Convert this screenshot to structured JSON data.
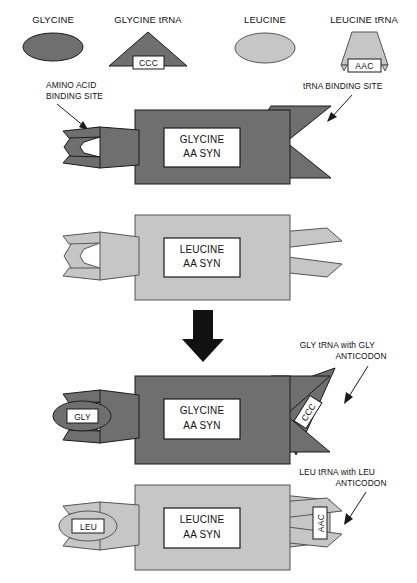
{
  "figure": {
    "background_color": "#ffffff",
    "palette": {
      "dark_gray": "#6f6f6f",
      "light_gray": "#c6c6c6",
      "outline": "#1a1a1a",
      "white": "#ffffff",
      "black": "#111111"
    }
  },
  "legend": {
    "items": [
      {
        "key": "glycine",
        "label": "GLYCINE",
        "shape": "ellipse",
        "fill": "#6f6f6f",
        "codon": null
      },
      {
        "key": "glycine_trna",
        "label": "GLYCINE tRNA",
        "shape": "triangle",
        "fill": "#6f6f6f",
        "codon": "CCC"
      },
      {
        "key": "leucine",
        "label": "LEUCINE",
        "shape": "ellipse",
        "fill": "#c6c6c6",
        "codon": null
      },
      {
        "key": "leucine_trna",
        "label": "LEUCINE tRNA",
        "shape": "trapezoid",
        "fill": "#c6c6c6",
        "codon": "AAC"
      }
    ]
  },
  "annotations": {
    "amino_acid_binding_site": {
      "line1": "AMINO ACID",
      "line2": "BINDING SITE"
    },
    "trna_binding_site": {
      "line1": "tRNA BINDING SITE",
      "line2": ""
    },
    "gly_trna_anticodon": {
      "line1": "GLY tRNA with GLY",
      "line2": "ANTICODON"
    },
    "leu_trna_anticodon": {
      "line1": "LEU tRNA with LEU",
      "line2": "ANTICODON"
    }
  },
  "panels": [
    {
      "key": "glycine_synthetase_empty",
      "enzyme_line1": "GLYCINE",
      "enzyme_line2": "AA SYN",
      "fill": "#6f6f6f",
      "bound_amino_acid": null,
      "bound_trna_codon": null
    },
    {
      "key": "leucine_synthetase_empty",
      "enzyme_line1": "LEUCINE",
      "enzyme_line2": "AA SYN",
      "fill": "#c6c6c6",
      "bound_amino_acid": null,
      "bound_trna_codon": null
    },
    {
      "key": "glycine_synthetase_bound",
      "enzyme_line1": "GLYCINE",
      "enzyme_line2": "AA SYN",
      "fill": "#6f6f6f",
      "bound_amino_acid": "GLY",
      "bound_trna_codon": "CCC"
    },
    {
      "key": "leucine_synthetase_bound",
      "enzyme_line1": "LEUCINE",
      "enzyme_line2": "AA SYN",
      "fill": "#c6c6c6",
      "bound_amino_acid": "LEU",
      "bound_trna_codon": "AAC"
    }
  ],
  "flow_arrow": {
    "name": "downward-process-arrow",
    "color": "#111111"
  }
}
